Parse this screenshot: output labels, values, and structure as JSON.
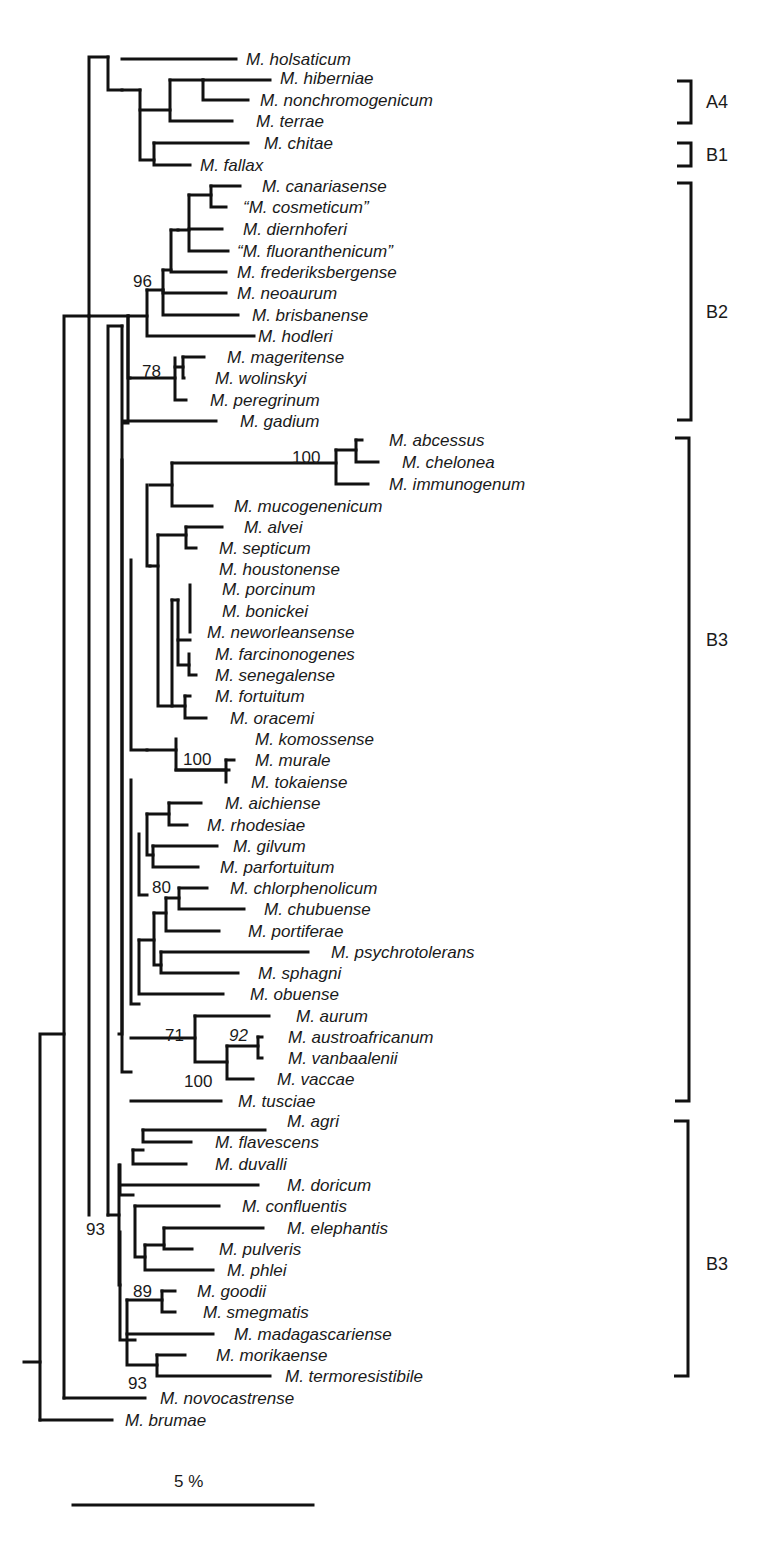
{
  "figure": {
    "type": "phylogenetic-tree",
    "scale_bar": {
      "label": "5 %",
      "x1": 73,
      "x2": 313,
      "y": 1505,
      "label_x": 174,
      "label_y": 1487
    }
  },
  "taxa": [
    {
      "name": "M. holsaticum",
      "x": 246,
      "y": 59,
      "tip": 236
    },
    {
      "name": "M. hiberniae",
      "x": 280,
      "y": 78,
      "tip": 270
    },
    {
      "name": "M. nonchromogenicum",
      "x": 260,
      "y": 100,
      "tip": 248
    },
    {
      "name": "M. terrae",
      "x": 256,
      "y": 121,
      "tip": 232
    },
    {
      "name": "M. chitae",
      "x": 264,
      "y": 143,
      "tip": 248
    },
    {
      "name": "M. fallax",
      "x": 200,
      "y": 165,
      "tip": 190
    },
    {
      "name": "M. canariasense",
      "x": 262,
      "y": 186,
      "tip": 240
    },
    {
      "name": "“M. cosmeticum”",
      "x": 243,
      "y": 207,
      "tip": 226
    },
    {
      "name": "M. diernhoferi",
      "x": 243,
      "y": 229,
      "tip": 222
    },
    {
      "name": "“M. fluoranthenicum”",
      "x": 237,
      "y": 251,
      "tip": 228
    },
    {
      "name": "M. frederiksbergense",
      "x": 237,
      "y": 272,
      "tip": 226
    },
    {
      "name": "M. neoaurum",
      "x": 237,
      "y": 293,
      "tip": 226
    },
    {
      "name": "M. brisbanense",
      "x": 252,
      "y": 315,
      "tip": 238
    },
    {
      "name": "M. hodleri",
      "x": 258,
      "y": 336,
      "tip": 254
    },
    {
      "name": "M. mageritense",
      "x": 227,
      "y": 357,
      "tip": 204
    },
    {
      "name": "M. wolinskyi",
      "x": 215,
      "y": 378,
      "tip": 184
    },
    {
      "name": "M. peregrinum",
      "x": 210,
      "y": 400,
      "tip": 186
    },
    {
      "name": "M. gadium",
      "x": 240,
      "y": 421,
      "tip": 216
    },
    {
      "name": "M. abcessus",
      "x": 389,
      "y": 440,
      "tip": 362
    },
    {
      "name": "M. chelonea",
      "x": 402,
      "y": 462,
      "tip": 378
    },
    {
      "name": "M. immunogenum",
      "x": 389,
      "y": 484,
      "tip": 368
    },
    {
      "name": "M. mucogenenicum",
      "x": 234,
      "y": 506,
      "tip": 212
    },
    {
      "name": "M. alvei",
      "x": 244,
      "y": 527,
      "tip": 222
    },
    {
      "name": "M. septicum",
      "x": 219,
      "y": 548,
      "tip": 196
    },
    {
      "name": "M. houstonense",
      "x": 219,
      "y": 569,
      "tip": 190
    },
    {
      "name": "M. porcinum",
      "x": 222,
      "y": 589,
      "tip": 190
    },
    {
      "name": "M. bonickei",
      "x": 222,
      "y": 611,
      "tip": 192
    },
    {
      "name": "M. neworleansense",
      "x": 207,
      "y": 632,
      "tip": 190
    },
    {
      "name": "M. farcinonogenes",
      "x": 215,
      "y": 654,
      "tip": 190
    },
    {
      "name": "M. senegalense",
      "x": 215,
      "y": 675,
      "tip": 196
    },
    {
      "name": "M. fortuitum",
      "x": 215,
      "y": 696,
      "tip": 190
    },
    {
      "name": "M. oracemi",
      "x": 230,
      "y": 718,
      "tip": 206
    },
    {
      "name": "M. komossense",
      "x": 255,
      "y": 739,
      "tip": 229
    },
    {
      "name": "M. murale",
      "x": 255,
      "y": 760,
      "tip": 234
    },
    {
      "name": "M. tokaiense",
      "x": 251,
      "y": 782,
      "tip": 226
    },
    {
      "name": "M. aichiense",
      "x": 225,
      "y": 803,
      "tip": 201
    },
    {
      "name": "M. rhodesiae",
      "x": 207,
      "y": 825,
      "tip": 187
    },
    {
      "name": "M. gilvum",
      "x": 233,
      "y": 846,
      "tip": 217
    },
    {
      "name": "M. parfortuitum",
      "x": 220,
      "y": 867,
      "tip": 198
    },
    {
      "name": "M. chlorphenolicum",
      "x": 230,
      "y": 888,
      "tip": 207
    },
    {
      "name": "M. chubuense",
      "x": 264,
      "y": 909,
      "tip": 244
    },
    {
      "name": "M. portiferae",
      "x": 248,
      "y": 931,
      "tip": 219
    },
    {
      "name": "M. psychrotolerans",
      "x": 331,
      "y": 952,
      "tip": 308
    },
    {
      "name": "M. sphagni",
      "x": 258,
      "y": 973,
      "tip": 238
    },
    {
      "name": "M. obuense",
      "x": 250,
      "y": 994,
      "tip": 223
    },
    {
      "name": "M. aurum",
      "x": 296,
      "y": 1016,
      "tip": 269
    },
    {
      "name": "M. austroafricanum",
      "x": 288,
      "y": 1037,
      "tip": 262
    },
    {
      "name": "M. vanbaalenii",
      "x": 288,
      "y": 1058,
      "tip": 262
    },
    {
      "name": "M. vaccae",
      "x": 277,
      "y": 1079,
      "tip": 253
    },
    {
      "name": "M. tusciae",
      "x": 238,
      "y": 1101,
      "tip": 221
    },
    {
      "name": "M. agri",
      "x": 287,
      "y": 1121,
      "tip": 265
    },
    {
      "name": "M. flavescens",
      "x": 215,
      "y": 1142,
      "tip": 191
    },
    {
      "name": "M. duvalli",
      "x": 215,
      "y": 1164,
      "tip": 186
    },
    {
      "name": "M. doricum",
      "x": 287,
      "y": 1185,
      "tip": 258
    },
    {
      "name": "M. confluentis",
      "x": 242,
      "y": 1206,
      "tip": 219
    },
    {
      "name": "M. elephantis",
      "x": 287,
      "y": 1228,
      "tip": 263
    },
    {
      "name": "M. pulveris",
      "x": 219,
      "y": 1249,
      "tip": 192
    },
    {
      "name": "M. phlei",
      "x": 227,
      "y": 1270,
      "tip": 213
    },
    {
      "name": "M. goodii",
      "x": 197,
      "y": 1291,
      "tip": 175
    },
    {
      "name": "M. smegmatis",
      "x": 203,
      "y": 1312,
      "tip": 175
    },
    {
      "name": "M. madagascariense",
      "x": 234,
      "y": 1334,
      "tip": 213
    },
    {
      "name": "M. morikaense",
      "x": 216,
      "y": 1355,
      "tip": 185
    },
    {
      "name": "M. termoresistibile",
      "x": 285,
      "y": 1376,
      "tip": 270
    },
    {
      "name": "M. novocastrense",
      "x": 160,
      "y": 1398,
      "tip": 145
    },
    {
      "name": "M. brumae",
      "x": 125,
      "y": 1420,
      "tip": 112
    }
  ],
  "support_values": [
    {
      "value": "96",
      "x": 133,
      "y": 287,
      "italic": false
    },
    {
      "value": "78",
      "x": 142,
      "y": 377,
      "italic": false
    },
    {
      "value": "100",
      "x": 292,
      "y": 463,
      "italic": false
    },
    {
      "value": "100",
      "x": 183,
      "y": 765,
      "italic": false
    },
    {
      "value": "80",
      "x": 152,
      "y": 893,
      "italic": false
    },
    {
      "value": "71",
      "x": 165,
      "y": 1041,
      "italic": false
    },
    {
      "value": "92",
      "x": 229,
      "y": 1041,
      "italic": true
    },
    {
      "value": "100",
      "x": 184,
      "y": 1087,
      "italic": false
    },
    {
      "value": "93",
      "x": 86,
      "y": 1235,
      "italic": false
    },
    {
      "value": "89",
      "x": 133,
      "y": 1297,
      "italic": false
    },
    {
      "value": "93",
      "x": 128,
      "y": 1389,
      "italic": false
    }
  ],
  "groups": [
    {
      "label": "A4",
      "top": 81,
      "bottom": 123,
      "x": 691,
      "label_x": 706,
      "label_y": 108
    },
    {
      "label": "B1",
      "top": 143,
      "bottom": 166,
      "x": 691,
      "label_x": 706,
      "label_y": 161
    },
    {
      "label": "B2",
      "top": 183,
      "bottom": 420,
      "x": 691,
      "label_x": 706,
      "label_y": 318
    },
    {
      "label": "B3",
      "top": 438,
      "bottom": 1101,
      "x": 689,
      "label_x": 706,
      "label_y": 646
    },
    {
      "label": "B3",
      "top": 1121,
      "bottom": 1376,
      "x": 688,
      "label_x": 706,
      "label_y": 1270
    }
  ],
  "branches": [
    "M24,1362 H40",
    "M40,1420 V1034 H64",
    "M40,1420 H112",
    "M64,1398 V316 H89",
    "M64,1398 H145",
    "M89,1215 V57 H108",
    "M108,1215 V326 H122",
    "M122,326 V1034 H119",
    "M108,57 V90 H122",
    "M122,59 H236",
    "M122,90 H140",
    "M140,90 V160 H154",
    "M140,110 H170",
    "M170,80 V121 H232",
    "M170,80 H203",
    "M203,80 H270",
    "M203,80 V100 H248",
    "M154,143 V165 H190",
    "M154,143 H248",
    "M89,316 H128",
    "M128,316 V423 H123",
    "M128,316 V378 H130",
    "M130,316 H147",
    "M147,290 V336 H254",
    "M147,290 H163",
    "M163,290 V315 H238",
    "M163,270 V293 H226",
    "M163,270 H171",
    "M171,230 V272 H226",
    "M171,230 H178",
    "M178,230 H189",
    "M189,195 V251 H228",
    "M189,229 H222",
    "M189,195 H211",
    "M211,186 V207 H226",
    "M211,186 H240",
    "M130,378 H175",
    "M175,358 V400 H186",
    "M175,367 H183",
    "M183,357 V378 H184",
    "M183,357 H204",
    "M123,421 H216",
    "M122,460 V1072 H131",
    "M131,560 V750 H147",
    "M147,485 V566 H150",
    "M150,485 H172",
    "M172,463 V506 H212",
    "M172,463 H336",
    "M336,450 V484 H368",
    "M336,450 H356",
    "M356,440 V462 H378",
    "M356,440 H362",
    "M150,566 H158",
    "M158,535 V706 H172",
    "M158,535 H186",
    "M186,527 V548 H196",
    "M186,527 H222",
    "M172,600 V706 H185",
    "M172,600 H178",
    "M178,600 V665 H189",
    "M178,640 H190",
    "M190,585 V632 H190",
    "M189,654 V675 H196",
    "M185,696 V718 H206",
    "M185,696 H190",
    "M147,750 H176",
    "M176,739 V770 H229",
    "M176,770 H226",
    "M226,760 V782 H226",
    "M226,760 H234",
    "M131,780 V1004 H139",
    "M139,834 V895 H147",
    "M147,814 V855 H153",
    "M147,814 H169",
    "M169,803 V825 H187",
    "M169,803 H201",
    "M153,846 V867 H198",
    "M153,846 H217",
    "M139,940 V994 H223",
    "M139,940 H154",
    "M154,913 V965 H161",
    "M154,913 H166",
    "M166,898 V931 H219",
    "M166,898 H179",
    "M179,888 V909 H244",
    "M179,888 H207",
    "M161,952 V973 H238",
    "M161,952 H308",
    "M131,1038 H195",
    "M195,1016 V1062 H227",
    "M195,1016 H269",
    "M227,1046 V1079 H253",
    "M227,1046 H258",
    "M258,1037 V1058 H262",
    "M258,1037 H262",
    "M131,1101 H221",
    "M108,1215 H119",
    "M119,1165 V1285 H120",
    "M120,1165 V1195 H133",
    "M133,1150 V1164 H186",
    "M133,1150 H143",
    "M143,1130 V1142 H191",
    "M143,1130 H265",
    "M120,1185 H258",
    "M120,1232 V1340 H135",
    "M135,1206 V1257 H145",
    "M135,1206 H219",
    "M145,1245 V1270 H213",
    "M145,1245 H164",
    "M164,1228 V1249 H192",
    "M164,1228 H263",
    "M127,1300 V1365 H157",
    "M127,1300 H162",
    "M162,1291 V1312 H175",
    "M162,1291 H175",
    "M127,1334 H213",
    "M157,1355 V1376 H270",
    "M157,1355 H185"
  ]
}
